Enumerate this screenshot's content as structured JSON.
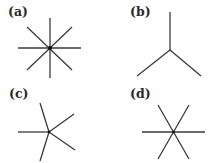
{
  "panels": [
    {
      "label": "(a)",
      "description": "8-fold star: four lines crossing at a common point"
    },
    {
      "label": "(b)",
      "description": "3-fold trigonal junction (Y shape)"
    },
    {
      "label": "(c)",
      "description": "5-fold asymmetric star"
    },
    {
      "label": "(d)",
      "description": "6-fold star: three lines crossing at a common point"
    }
  ],
  "colors": {
    "stroke": "#3a3a3a",
    "background": "#ffffff"
  }
}
